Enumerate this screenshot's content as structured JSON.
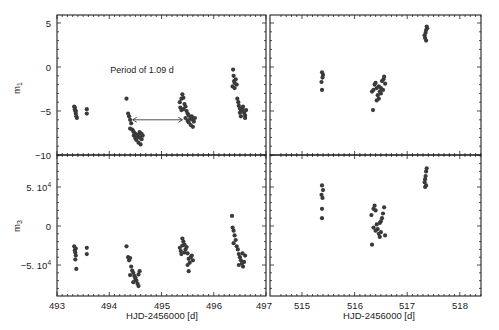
{
  "chart_data": [
    {
      "type": "scatter",
      "panel": "top-left",
      "xlabel": "",
      "ylabel": "m1",
      "xlim": [
        493,
        497
      ],
      "ylim": [
        -10,
        6
      ],
      "yticks": [
        5,
        0,
        -5,
        -10
      ],
      "ytick_labels": [
        "5",
        "0",
        "-5",
        "-10"
      ],
      "annotation": {
        "text": "Period of 1.09 d",
        "arrow_from_x": 494.45,
        "arrow_to_x": 495.4,
        "arrow_y": -6.0
      },
      "points": [
        [
          493.33,
          -4.5
        ],
        [
          493.34,
          -4.8
        ],
        [
          493.35,
          -5.0
        ],
        [
          493.36,
          -5.3
        ],
        [
          493.37,
          -5.6
        ],
        [
          493.38,
          -5.8
        ],
        [
          493.36,
          -5.0
        ],
        [
          493.34,
          -4.6
        ],
        [
          493.57,
          -4.8
        ],
        [
          493.57,
          -5.3
        ],
        [
          494.33,
          -3.6
        ],
        [
          494.36,
          -5.3
        ],
        [
          494.38,
          -5.6
        ],
        [
          494.4,
          -6.0
        ],
        [
          494.42,
          -6.4
        ],
        [
          494.4,
          -7.0
        ],
        [
          494.44,
          -7.1
        ],
        [
          494.46,
          -7.3
        ],
        [
          494.48,
          -7.5
        ],
        [
          494.5,
          -7.6
        ],
        [
          494.47,
          -7.8
        ],
        [
          494.52,
          -7.9
        ],
        [
          494.55,
          -7.7
        ],
        [
          494.58,
          -8.0
        ],
        [
          494.52,
          -8.3
        ],
        [
          494.56,
          -8.6
        ],
        [
          494.6,
          -8.8
        ],
        [
          494.62,
          -8.2
        ],
        [
          494.64,
          -7.8
        ],
        [
          494.58,
          -7.4
        ],
        [
          494.62,
          -7.6
        ],
        [
          494.5,
          -8.1
        ],
        [
          495.35,
          -4.0
        ],
        [
          495.36,
          -4.6
        ],
        [
          495.38,
          -3.6
        ],
        [
          495.4,
          -3.1
        ],
        [
          495.42,
          -3.5
        ],
        [
          495.44,
          -4.2
        ],
        [
          495.38,
          -4.9
        ],
        [
          495.46,
          -4.5
        ],
        [
          495.48,
          -5.0
        ],
        [
          495.5,
          -5.3
        ],
        [
          495.52,
          -5.5
        ],
        [
          495.46,
          -5.8
        ],
        [
          495.55,
          -5.9
        ],
        [
          495.58,
          -5.6
        ],
        [
          495.6,
          -6.0
        ],
        [
          495.52,
          -6.3
        ],
        [
          495.56,
          -6.6
        ],
        [
          495.6,
          -6.8
        ],
        [
          495.62,
          -6.2
        ],
        [
          495.64,
          -5.8
        ],
        [
          495.5,
          -6.1
        ],
        [
          495.42,
          -4.8
        ],
        [
          496.37,
          -0.3
        ],
        [
          496.38,
          -1.0
        ],
        [
          496.39,
          -1.6
        ],
        [
          496.4,
          -1.8
        ],
        [
          496.36,
          -2.2
        ],
        [
          496.42,
          -1.4
        ],
        [
          496.44,
          -2.0
        ],
        [
          496.4,
          -2.4
        ],
        [
          496.45,
          -3.6
        ],
        [
          496.47,
          -4.0
        ],
        [
          496.48,
          -4.4
        ],
        [
          496.5,
          -4.7
        ],
        [
          496.52,
          -5.0
        ],
        [
          496.55,
          -4.8
        ],
        [
          496.58,
          -5.2
        ],
        [
          496.6,
          -5.5
        ],
        [
          496.52,
          -5.6
        ],
        [
          496.62,
          -4.9
        ],
        [
          496.56,
          -4.5
        ],
        [
          496.6,
          -5.8
        ],
        [
          496.5,
          -5.2
        ]
      ]
    },
    {
      "type": "scatter",
      "panel": "top-right",
      "xlabel": "",
      "ylabel": "",
      "xlim": [
        514.7,
        518.7
      ],
      "ylim": [
        -10,
        6
      ],
      "points": [
        [
          515.38,
          -0.6
        ],
        [
          515.4,
          -0.9
        ],
        [
          515.39,
          -1.2
        ],
        [
          515.37,
          -1.7
        ],
        [
          515.38,
          -2.6
        ],
        [
          516.35,
          -4.9
        ],
        [
          516.33,
          -2.8
        ],
        [
          516.36,
          -2.6
        ],
        [
          516.38,
          -2.0
        ],
        [
          516.4,
          -1.8
        ],
        [
          516.42,
          -2.4
        ],
        [
          516.44,
          -3.2
        ],
        [
          516.46,
          -3.6
        ],
        [
          516.42,
          -3.8
        ],
        [
          516.48,
          -2.8
        ],
        [
          516.5,
          -2.4
        ],
        [
          516.52,
          -1.6
        ],
        [
          516.55,
          -1.4
        ],
        [
          516.56,
          -1.1
        ],
        [
          516.58,
          -1.9
        ],
        [
          516.5,
          -3.0
        ],
        [
          516.46,
          -2.2
        ],
        [
          516.54,
          -2.6
        ],
        [
          517.33,
          3.6
        ],
        [
          517.34,
          3.3
        ],
        [
          517.35,
          3.9
        ],
        [
          517.36,
          4.2
        ],
        [
          517.37,
          4.6
        ],
        [
          517.38,
          4.4
        ],
        [
          517.36,
          3.0
        ]
      ]
    },
    {
      "type": "scatter",
      "panel": "bottom-left",
      "xlabel": "HJD-2456000 [d]",
      "ylabel": "m3",
      "xlim": [
        493,
        497
      ],
      "ylim": [
        -90000,
        95000
      ],
      "xticks": [
        493,
        494,
        495,
        496,
        497
      ],
      "xtick_labels": [
        "493",
        "494",
        "495",
        "496",
        "497"
      ],
      "yticks": [
        50000,
        0,
        -50000
      ],
      "ytick_labels": [
        "5. 10^4",
        "0",
        "-5. 10^4"
      ],
      "points": [
        [
          493.33,
          -26000
        ],
        [
          493.34,
          -31000
        ],
        [
          493.35,
          -34000
        ],
        [
          493.36,
          -38000
        ],
        [
          493.35,
          -43000
        ],
        [
          493.37,
          -55000
        ],
        [
          493.36,
          -29000
        ],
        [
          493.57,
          -28000
        ],
        [
          493.57,
          -36000
        ],
        [
          494.33,
          -26000
        ],
        [
          494.36,
          -40000
        ],
        [
          494.38,
          -44000
        ],
        [
          494.4,
          -41000
        ],
        [
          494.42,
          -52000
        ],
        [
          494.44,
          -57000
        ],
        [
          494.46,
          -60000
        ],
        [
          494.4,
          -63000
        ],
        [
          494.48,
          -64000
        ],
        [
          494.5,
          -68000
        ],
        [
          494.52,
          -70000
        ],
        [
          494.46,
          -72000
        ],
        [
          494.54,
          -74000
        ],
        [
          494.56,
          -77000
        ],
        [
          494.5,
          -66000
        ],
        [
          494.56,
          -62000
        ],
        [
          494.58,
          -58000
        ],
        [
          495.35,
          -28000
        ],
        [
          495.37,
          -32000
        ],
        [
          495.38,
          -36000
        ],
        [
          495.4,
          -16000
        ],
        [
          495.42,
          -20000
        ],
        [
          495.44,
          -24000
        ],
        [
          495.46,
          -30000
        ],
        [
          495.48,
          -27000
        ],
        [
          495.5,
          -35000
        ],
        [
          495.52,
          -42000
        ],
        [
          495.54,
          -47000
        ],
        [
          495.56,
          -40000
        ],
        [
          495.58,
          -38000
        ],
        [
          495.5,
          -50000
        ],
        [
          495.52,
          -58000
        ],
        [
          495.6,
          -44000
        ],
        [
          495.44,
          -34000
        ],
        [
          495.4,
          -25000
        ],
        [
          496.35,
          13000
        ],
        [
          496.36,
          -2000
        ],
        [
          496.38,
          -6000
        ],
        [
          496.4,
          -12000
        ],
        [
          496.42,
          -18000
        ],
        [
          496.38,
          -22000
        ],
        [
          496.44,
          -26000
        ],
        [
          496.46,
          -30000
        ],
        [
          496.48,
          -36000
        ],
        [
          496.5,
          -40000
        ],
        [
          496.52,
          -44000
        ],
        [
          496.54,
          -48000
        ],
        [
          496.56,
          -52000
        ],
        [
          496.58,
          -46000
        ],
        [
          496.6,
          -38000
        ],
        [
          496.48,
          -50000
        ],
        [
          496.55,
          -35000
        ]
      ]
    },
    {
      "type": "scatter",
      "panel": "bottom-right",
      "xlabel": "HJD-2456000 [d]",
      "ylabel": "",
      "xlim": [
        514.7,
        518.7
      ],
      "ylim": [
        -90000,
        95000
      ],
      "xticks": [
        515,
        516,
        517,
        518
      ],
      "xtick_labels": [
        "515",
        "516",
        "517",
        "518"
      ],
      "points": [
        [
          515.38,
          52000
        ],
        [
          515.4,
          46000
        ],
        [
          515.37,
          40000
        ],
        [
          515.39,
          36000
        ],
        [
          515.38,
          22000
        ],
        [
          515.38,
          10000
        ],
        [
          516.33,
          -24000
        ],
        [
          516.32,
          14000
        ],
        [
          516.36,
          22000
        ],
        [
          516.38,
          26000
        ],
        [
          516.4,
          20000
        ],
        [
          516.42,
          2000
        ],
        [
          516.44,
          -4000
        ],
        [
          516.46,
          -10000
        ],
        [
          516.48,
          -14000
        ],
        [
          516.5,
          6000
        ],
        [
          516.52,
          10000
        ],
        [
          516.54,
          16000
        ],
        [
          516.56,
          24000
        ],
        [
          516.58,
          -12000
        ],
        [
          516.4,
          -6000
        ],
        [
          516.36,
          -2000
        ],
        [
          516.48,
          4000
        ],
        [
          516.5,
          -8000
        ],
        [
          517.33,
          56000
        ],
        [
          517.34,
          60000
        ],
        [
          517.35,
          64000
        ],
        [
          517.36,
          70000
        ],
        [
          517.37,
          74000
        ],
        [
          517.36,
          52000
        ],
        [
          517.34,
          50000
        ]
      ]
    }
  ]
}
